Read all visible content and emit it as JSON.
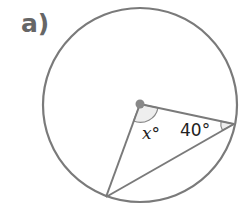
{
  "question_label": "a)",
  "diagram": {
    "circle": {
      "cx": 140,
      "cy": 105,
      "r": 97
    },
    "center_point": {
      "x": 140,
      "y": 104
    },
    "chord_point_right": {
      "x": 234,
      "y": 124
    },
    "chord_point_bottom": {
      "x": 106,
      "y": 197
    },
    "angle_at_center_label": "x°",
    "angle_at_right_label": "40°",
    "stroke_color": "#7a7a7a",
    "fill_color": "#e8e8e8"
  }
}
